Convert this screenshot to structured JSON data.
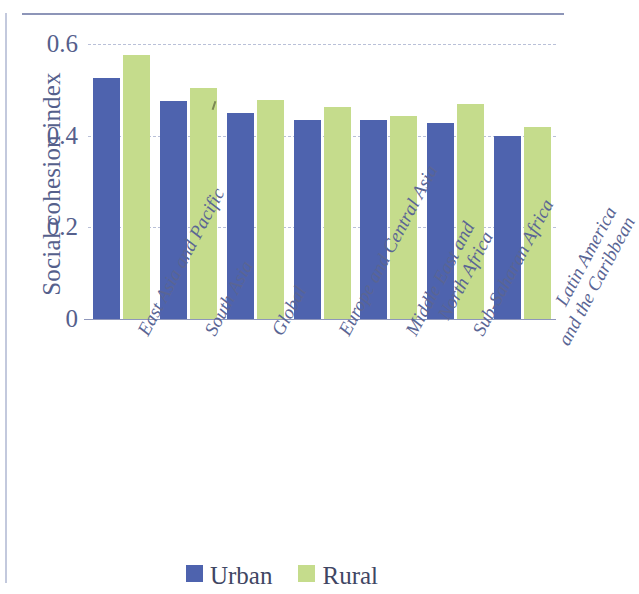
{
  "chart_data": {
    "type": "bar",
    "title": "",
    "xlabel": "",
    "ylabel": "Social cohesion index",
    "ylim": [
      0,
      0.6
    ],
    "yticks": [
      "0",
      "0.2",
      "0.4",
      "0.6"
    ],
    "ytick_values": [
      0,
      0.2,
      0.4,
      0.6
    ],
    "grid": "horizontal dashed",
    "legend_position": "bottom-center",
    "categories": [
      "East Asia and Pacific",
      "South Asia",
      "Global",
      "Europe and Central Asia",
      "Middle East and North Africa",
      "Sub-Saharan Africa",
      "Latin America and the Caribbean"
    ],
    "category_lines": [
      [
        "East Asia and Pacific"
      ],
      [
        "South Asia"
      ],
      [
        "Global"
      ],
      [
        "Europe and Central Asia"
      ],
      [
        "Middle East and",
        "North Africa"
      ],
      [
        "Sub-Saharan Africa"
      ],
      [
        "Latin America",
        "and the Caribbean"
      ]
    ],
    "series": [
      {
        "name": "Urban",
        "color": "#4e63ae",
        "values": [
          0.525,
          0.475,
          0.45,
          0.435,
          0.435,
          0.428,
          0.4
        ]
      },
      {
        "name": "Rural",
        "color": "#c5dc8c",
        "values": [
          0.575,
          0.505,
          0.478,
          0.462,
          0.443,
          0.47,
          0.42
        ]
      }
    ]
  },
  "legend": {
    "items": [
      {
        "label": "Urban",
        "color": "#4e63ae"
      },
      {
        "label": "Rural",
        "color": "#c5dc8c"
      }
    ]
  },
  "axis": {
    "y_title": "Social cohesion index"
  }
}
